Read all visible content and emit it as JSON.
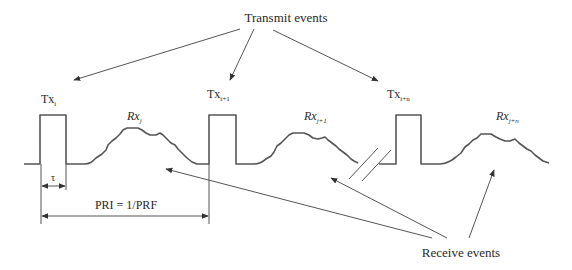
{
  "diagram": {
    "colors": {
      "stroke": "#555555",
      "text": "#2a2a2a",
      "background": "#ffffff"
    },
    "labels": {
      "transmit_events": "Transmit events",
      "receive_events": "Receive events",
      "tau": "τ",
      "pri": "PRI = 1/PRF"
    },
    "transmit_pulses": [
      {
        "base": "Tx",
        "sub": "i"
      },
      {
        "base": "Tx",
        "sub": "i+1"
      },
      {
        "base": "Tx",
        "sub": "i+n"
      }
    ],
    "receive_echoes": [
      {
        "base": "Rx",
        "sub": "j"
      },
      {
        "base": "Rx",
        "sub": "j+1"
      },
      {
        "base": "Rx",
        "sub": "j+n"
      }
    ],
    "annotations": {
      "break_mark": "time axis break (//)",
      "tau_meaning": "pulse width",
      "pri_meaning": "pulse repetition interval"
    }
  }
}
